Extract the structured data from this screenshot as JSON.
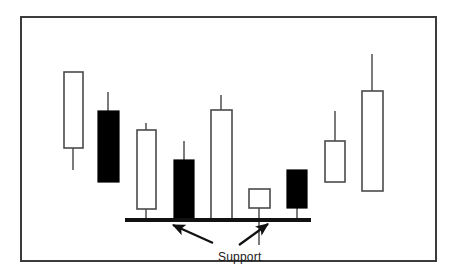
{
  "figure": {
    "type": "candlestick-chart",
    "border_color": "#3b3b3b",
    "background_color": "#ffffff"
  },
  "annotations": {
    "support_label": "Support",
    "support_line": {
      "name": "support-level-line",
      "color": "#111111",
      "x_start": 125,
      "x_end": 311,
      "y": 220,
      "thickness": 4
    },
    "arrows": [
      {
        "name": "support-arrow-left",
        "from_x": 213,
        "from_y": 243,
        "to_x": 173,
        "to_y": 225,
        "direction": "up-left"
      },
      {
        "name": "support-arrow-right",
        "from_x": 239,
        "from_y": 245,
        "to_x": 268,
        "to_y": 224,
        "direction": "up-right"
      }
    ]
  },
  "chart_data": {
    "type": "candlestick",
    "title": "",
    "subtitle": "",
    "xlabel": "",
    "ylabel": "",
    "grid": false,
    "legend": false,
    "annotations": [
      "Support"
    ],
    "colors": {
      "bullish_fill": "#ffffff",
      "bearish_fill": "#000000",
      "outline": "#4a4a4a",
      "wick": "#5a5a5a",
      "support_line": "#111111"
    },
    "axis_note": "Vertical axis is price (unlabeled); horizontal axis is time (unlabeled, 9 sessions).",
    "support_level_y_px": 220,
    "categories": [
      1,
      2,
      3,
      4,
      5,
      6,
      7,
      8,
      9
    ],
    "candles": [
      {
        "index": 1,
        "name": "candle-1",
        "type": "bullish",
        "fill": "white",
        "body_left_px": 64,
        "body_right_px": 83,
        "body_top_px": 72,
        "body_bottom_px": 148,
        "wick_x_px": 73,
        "wick_high_px": 72,
        "wick_low_px": 170
      },
      {
        "index": 2,
        "name": "candle-2",
        "type": "bearish",
        "fill": "black",
        "body_left_px": 98,
        "body_right_px": 119,
        "body_top_px": 111,
        "body_bottom_px": 182,
        "wick_x_px": 108,
        "wick_high_px": 92,
        "wick_low_px": 182
      },
      {
        "index": 3,
        "name": "candle-3",
        "type": "bullish",
        "fill": "white",
        "body_left_px": 137,
        "body_right_px": 156,
        "body_top_px": 130,
        "body_bottom_px": 209,
        "wick_x_px": 146,
        "wick_high_px": 123,
        "wick_low_px": 220
      },
      {
        "index": 4,
        "name": "candle-4",
        "type": "bearish",
        "fill": "black",
        "body_left_px": 174,
        "body_right_px": 194,
        "body_top_px": 160,
        "body_bottom_px": 220,
        "wick_x_px": 184,
        "wick_high_px": 141,
        "wick_low_px": 220
      },
      {
        "index": 5,
        "name": "candle-5",
        "type": "bullish",
        "fill": "white",
        "body_left_px": 211,
        "body_right_px": 232,
        "body_top_px": 110,
        "body_bottom_px": 220,
        "wick_x_px": 221,
        "wick_high_px": 95,
        "wick_low_px": 220
      },
      {
        "index": 6,
        "name": "candle-6",
        "type": "bullish",
        "fill": "white",
        "body_left_px": 249,
        "body_right_px": 270,
        "body_top_px": 189,
        "body_bottom_px": 208,
        "wick_x_px": 259,
        "wick_high_px": 189,
        "wick_low_px": 245
      },
      {
        "index": 7,
        "name": "candle-7",
        "type": "bearish",
        "fill": "black",
        "body_left_px": 287,
        "body_right_px": 307,
        "body_top_px": 170,
        "body_bottom_px": 208,
        "wick_x_px": 297,
        "wick_high_px": 170,
        "wick_low_px": 220
      },
      {
        "index": 8,
        "name": "candle-8",
        "type": "bullish",
        "fill": "white",
        "body_left_px": 325,
        "body_right_px": 345,
        "body_top_px": 141,
        "body_bottom_px": 182,
        "wick_x_px": 335,
        "wick_high_px": 111,
        "wick_low_px": 182
      },
      {
        "index": 9,
        "name": "candle-9",
        "type": "bullish",
        "fill": "white",
        "body_left_px": 362,
        "body_right_px": 383,
        "body_top_px": 91,
        "body_bottom_px": 191,
        "wick_x_px": 372,
        "wick_high_px": 54,
        "wick_low_px": 191
      }
    ]
  }
}
